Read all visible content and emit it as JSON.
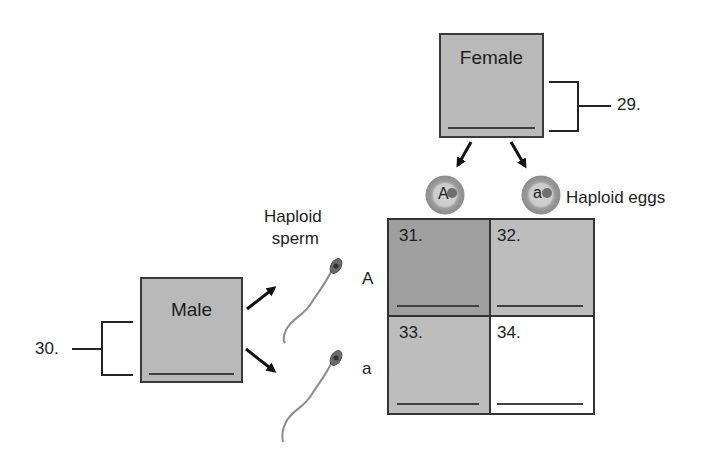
{
  "female": {
    "title": "Female",
    "question_number": "29."
  },
  "male": {
    "title": "Male",
    "question_number": "30."
  },
  "eggs": {
    "label": "Haploid eggs",
    "alleles": [
      "A",
      "a"
    ]
  },
  "sperm": {
    "label_line1": "Haploid",
    "label_line2": "sperm",
    "alleles": [
      "A",
      "a"
    ]
  },
  "punnett": {
    "cells": [
      {
        "number": "31.",
        "row": "A",
        "col": "A",
        "shade": "#9e9e9e"
      },
      {
        "number": "32.",
        "row": "A",
        "col": "a",
        "shade": "#bdbdbd"
      },
      {
        "number": "33.",
        "row": "a",
        "col": "A",
        "shade": "#bdbdbd"
      },
      {
        "number": "34.",
        "row": "a",
        "col": "a",
        "shade": "#ffffff"
      }
    ]
  },
  "colors": {
    "box_fill": "#b9b9b9",
    "dark_cell": "#9e9e9e",
    "light_cell": "#bdbdbd",
    "outline": "#3a3a3a"
  }
}
